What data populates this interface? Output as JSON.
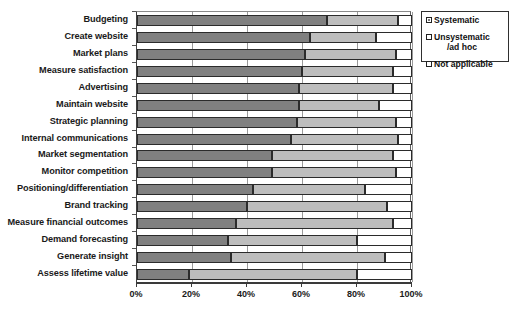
{
  "chart_data": {
    "type": "bar",
    "orientation": "horizontal",
    "stacked": true,
    "normalized": true,
    "title": "",
    "xlabel": "",
    "ylabel": "",
    "xlim": [
      0,
      100
    ],
    "xticks": [
      0,
      20,
      40,
      60,
      80,
      100
    ],
    "xtick_labels": [
      "0%",
      "20%",
      "40%",
      "60%",
      "80%",
      "100%"
    ],
    "grid": true,
    "legend_position": "top-right",
    "categories": [
      "Budgeting",
      "Create website",
      "Market plans",
      "Measure satisfaction",
      "Advertising",
      "Maintain website",
      "Strategic planning",
      "Internal communications",
      "Market segmentation",
      "Monitor competition",
      "Positioning/differentiation",
      "Brand tracking",
      "Measure financial outcomes",
      "Demand forecasting",
      "Generate insight",
      "Assess lifetime value"
    ],
    "series": [
      {
        "name": "Systematic",
        "color": "#808080",
        "values": [
          69,
          63,
          61,
          60,
          59,
          59,
          58,
          56,
          49,
          49,
          42,
          40,
          36,
          33,
          34,
          19
        ]
      },
      {
        "name": "Unsystematic /ad hoc",
        "color": "#bdbdbd",
        "values": [
          26,
          24,
          33,
          33,
          34,
          29,
          36,
          39,
          44,
          45,
          41,
          51,
          57,
          47,
          56,
          61
        ]
      },
      {
        "name": "Not applicable",
        "color": "#ffffff",
        "values": [
          5,
          13,
          6,
          7,
          7,
          12,
          6,
          5,
          7,
          6,
          17,
          9,
          7,
          20,
          10,
          20
        ]
      }
    ]
  },
  "legend": {
    "items": [
      {
        "label": "Systematic",
        "label_line2": ""
      },
      {
        "label": "Unsystematic",
        "label_line2": "/ad hoc"
      },
      {
        "label": "Not applicable",
        "label_line2": ""
      }
    ]
  },
  "colors": {
    "systematic": "#808080",
    "unsystematic": "#bdbdbd",
    "not_applicable": "#ffffff",
    "outline": "#2b2b2b",
    "axis": "#3a3a3a"
  }
}
